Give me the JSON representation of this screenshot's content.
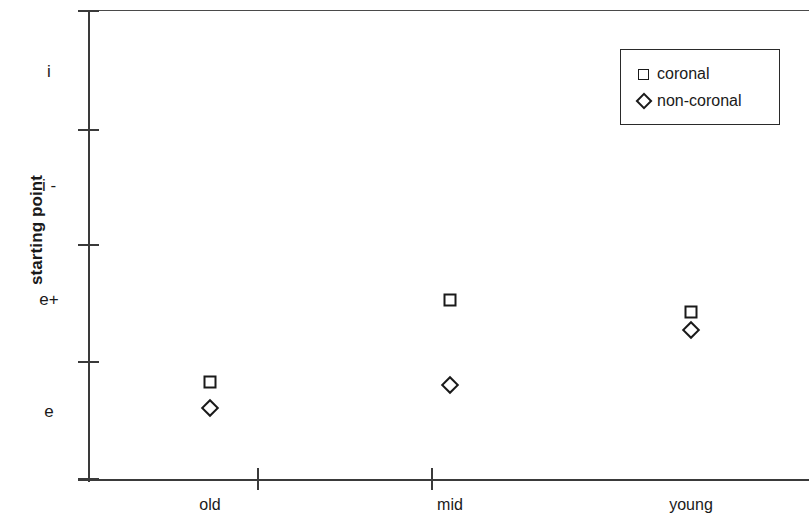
{
  "chart_data": {
    "type": "scatter",
    "title": "",
    "xlabel": "",
    "ylabel": "starting point",
    "categories": [
      "old",
      "mid",
      "young"
    ],
    "y_tick_labels": [
      "i",
      "i -",
      "e+",
      "e"
    ],
    "y_tick_label_values": [
      4,
      3,
      2,
      1
    ],
    "ylim": [
      0.5,
      4.5
    ],
    "grid": false,
    "legend_position": "top-right",
    "series": [
      {
        "name": "coronal",
        "marker": "square",
        "values": [
          1.28,
          2.05,
          1.92
        ]
      },
      {
        "name": "non-coronal",
        "marker": "diamond",
        "values": [
          1.05,
          1.25,
          1.77
        ]
      }
    ]
  },
  "axis": {
    "y_title": "starting point",
    "y_ticks": [
      {
        "label": "i",
        "pixel_y": 72
      },
      {
        "label": "i -",
        "pixel_y": 186
      },
      {
        "label": "e+",
        "pixel_y": 300
      },
      {
        "label": "e",
        "pixel_y": 412
      }
    ],
    "y_tick_marks_pixel_y": [
      11,
      130,
      245,
      362,
      479
    ],
    "x_tick_marks_pixel_x": [
      258,
      432
    ],
    "x_categories": [
      {
        "label": "old",
        "pixel_x": 210
      },
      {
        "label": "mid",
        "pixel_x": 450
      },
      {
        "label": "young",
        "pixel_x": 691
      }
    ]
  },
  "points": [
    {
      "series": "coronal",
      "category": "old",
      "marker": "square",
      "pixel_x": 210,
      "pixel_y": 382
    },
    {
      "series": "non-coronal",
      "category": "old",
      "marker": "diamond",
      "pixel_x": 210,
      "pixel_y": 408
    },
    {
      "series": "coronal",
      "category": "mid",
      "marker": "square",
      "pixel_x": 450,
      "pixel_y": 300
    },
    {
      "series": "non-coronal",
      "category": "mid",
      "marker": "diamond",
      "pixel_x": 450,
      "pixel_y": 385
    },
    {
      "series": "coronal",
      "category": "young",
      "marker": "square",
      "pixel_x": 691,
      "pixel_y": 312
    },
    {
      "series": "non-coronal",
      "category": "young",
      "marker": "diamond",
      "pixel_x": 691,
      "pixel_y": 330
    }
  ],
  "legend": {
    "entries": [
      {
        "label": "coronal",
        "marker": "square"
      },
      {
        "label": "non-coronal",
        "marker": "diamond"
      }
    ]
  },
  "colors": {
    "ink": "#1a1a1a",
    "axis": "#3a3a3a",
    "background": "#ffffff"
  }
}
